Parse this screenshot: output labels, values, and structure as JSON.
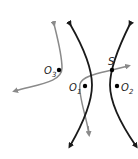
{
  "diagram": {
    "type": "hyperbola-with-curves",
    "colors": {
      "hyperbola": "#1a1a1a",
      "gray_curves": "#8a8a8a",
      "points": "#000000",
      "labels": "#222222",
      "background": "#ffffff"
    },
    "points": [
      {
        "id": "O3",
        "label": "O",
        "sub": "3",
        "x": 59,
        "y": 70
      },
      {
        "id": "O1",
        "label": "O",
        "sub": "1",
        "x": 85,
        "y": 86
      },
      {
        "id": "O2",
        "label": "O",
        "sub": "2",
        "x": 117,
        "y": 86
      },
      {
        "id": "S",
        "label": "S",
        "sub": "",
        "x": 112,
        "y": 70
      }
    ],
    "labels": {
      "o3_main": "O",
      "o3_sub": "3",
      "o1_main": "O",
      "o1_sub": "1",
      "o2_main": "O",
      "o2_sub": "2",
      "s_main": "S"
    }
  }
}
